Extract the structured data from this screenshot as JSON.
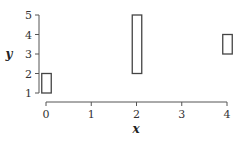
{
  "chart_data": {
    "type": "bar",
    "subtype": "floating-rectangles",
    "title": "",
    "xlabel": "x",
    "ylabel": "y",
    "xlim": [
      0,
      4
    ],
    "ylim": [
      1,
      5
    ],
    "x_ticks": [
      "0",
      "1",
      "2",
      "3",
      "4"
    ],
    "y_ticks": [
      "1",
      "2",
      "3",
      "4",
      "5"
    ],
    "grid": false,
    "legend": null,
    "rectangles": [
      {
        "x": 0,
        "y_low": 1,
        "y_high": 2
      },
      {
        "x": 2,
        "y_low": 2,
        "y_high": 5
      },
      {
        "x": 4,
        "y_low": 3,
        "y_high": 4
      }
    ],
    "style": {
      "fill": "#ffffff",
      "stroke": "#444444"
    }
  }
}
